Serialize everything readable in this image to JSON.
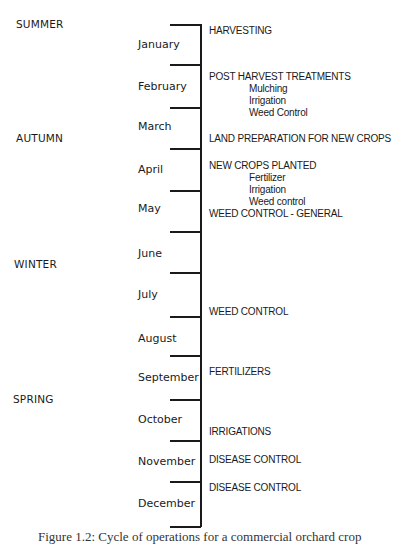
{
  "seasons": [
    {
      "label": "SUMMER",
      "x": 16,
      "y": 18
    },
    {
      "label": "AUTUMN",
      "x": 16,
      "y": 132
    },
    {
      "label": "WINTER",
      "x": 14,
      "y": 258
    },
    {
      "label": "SPRING",
      "x": 13,
      "y": 393
    }
  ],
  "months": [
    {
      "label": "January",
      "y": 38
    },
    {
      "label": "February",
      "y": 80
    },
    {
      "label": "March",
      "y": 120
    },
    {
      "label": "April",
      "y": 163
    },
    {
      "label": "May",
      "y": 202
    },
    {
      "label": "June",
      "y": 247
    },
    {
      "label": "July",
      "y": 288
    },
    {
      "label": "August",
      "y": 332
    },
    {
      "label": "September",
      "y": 371
    },
    {
      "label": "October",
      "y": 413
    },
    {
      "label": "November",
      "y": 455
    },
    {
      "label": "December",
      "y": 497
    }
  ],
  "ticks_y": [
    24,
    64,
    107,
    148,
    190,
    231,
    272,
    316,
    355,
    399,
    440,
    481,
    526
  ],
  "activities": [
    {
      "title": "HARVESTING",
      "y": 25,
      "items": []
    },
    {
      "title": "POST HARVEST TREATMENTS",
      "y": 71,
      "items": [
        "Mulching",
        "Irrigation",
        "Weed Control"
      ]
    },
    {
      "title": "LAND PREPARATION FOR NEW CROPS",
      "y": 133,
      "items": []
    },
    {
      "title": "NEW CROPS PLANTED",
      "y": 160,
      "items": [
        "Fertilizer",
        "Irrigation",
        "Weed control"
      ]
    },
    {
      "title": "WEED CONTROL - GENERAL",
      "y": 208,
      "items": []
    },
    {
      "title": "WEED CONTROL",
      "y": 306,
      "items": []
    },
    {
      "title": "FERTILIZERS",
      "y": 366,
      "items": []
    },
    {
      "title": "IRRIGATIONS",
      "y": 426,
      "items": []
    },
    {
      "title": "DISEASE CONTROL",
      "y": 454,
      "items": []
    },
    {
      "title": "DISEASE CONTROL",
      "y": 482,
      "items": []
    }
  ],
  "caption": "Figure 1.2: Cycle of operations for a commercial orchard crop"
}
